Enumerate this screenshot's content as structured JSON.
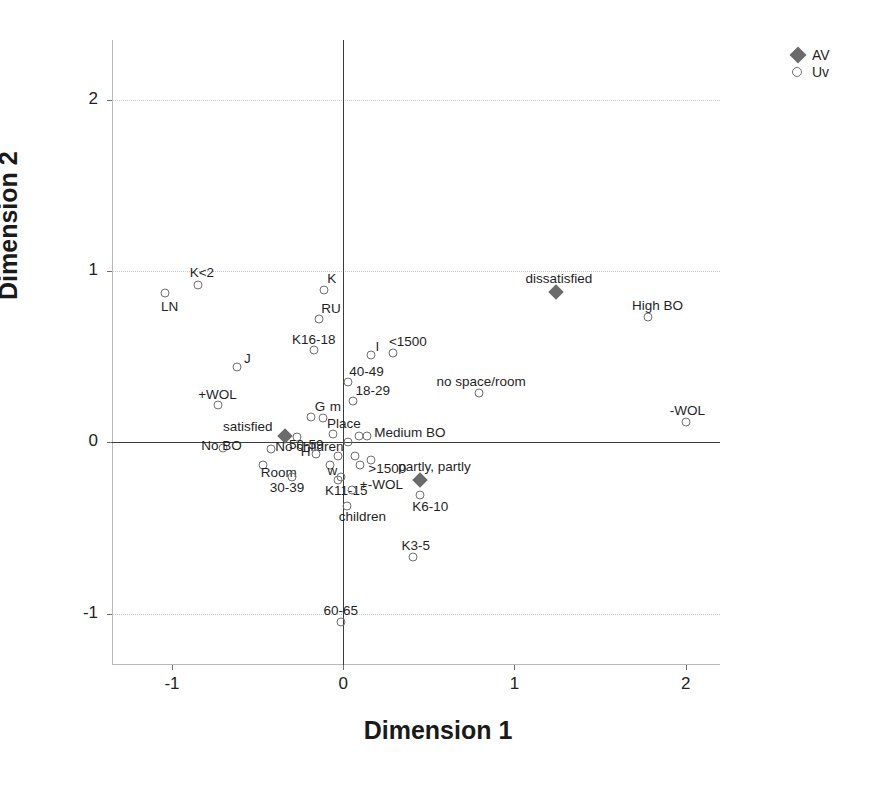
{
  "chart_data": {
    "type": "scatter",
    "title": "",
    "xlabel": "Dimension 1",
    "ylabel": "Dimension 2",
    "xlim": [
      -1.35,
      2.2
    ],
    "ylim": [
      -1.3,
      2.35
    ],
    "xticks": [
      -1,
      0,
      1,
      2
    ],
    "xticklabels": [
      "-1",
      "0",
      "1",
      "2"
    ],
    "yticks": [
      2,
      1,
      0,
      -1
    ],
    "yticklabels": [
      "2",
      "1",
      "0",
      "-1"
    ],
    "grid": "dotted horizontal gridlines at y = 2, 1, -1; solid axis lines at x = 0 and y = 0",
    "legend_position": "top-right outside",
    "legend": [
      {
        "name": "AV",
        "marker": "filled-diamond",
        "color": "#6b6b6b"
      },
      {
        "name": "Uv",
        "marker": "open-circle",
        "color": "#707070"
      }
    ],
    "series": [
      {
        "name": "AV",
        "marker": "filled-diamond",
        "points": [
          {
            "label": "satisfied",
            "x": -0.34,
            "y": 0.04,
            "label_dx": -62,
            "label_dy": -16
          },
          {
            "label": "dissatisfied",
            "x": 1.24,
            "y": 0.88,
            "label_dx": -30,
            "label_dy": -20
          },
          {
            "label": "partly, partly",
            "x": 0.45,
            "y": -0.22,
            "label_dx": -22,
            "label_dy": -20
          }
        ]
      },
      {
        "name": "Uv",
        "marker": "open-circle",
        "points": [
          {
            "label": "K<2",
            "x": -0.85,
            "y": 0.92,
            "label_dx": -8,
            "label_dy": -19
          },
          {
            "label": "LN",
            "x": -1.04,
            "y": 0.87,
            "label_dx": -4,
            "label_dy": 7
          },
          {
            "label": "K",
            "x": -0.11,
            "y": 0.89,
            "label_dx": 3,
            "label_dy": -18
          },
          {
            "label": "RU",
            "x": -0.14,
            "y": 0.72,
            "label_dx": 2,
            "label_dy": -17
          },
          {
            "label": "K16-18",
            "x": -0.17,
            "y": 0.54,
            "label_dx": -22,
            "label_dy": -17
          },
          {
            "label": "J",
            "x": -0.62,
            "y": 0.44,
            "label_dx": 7,
            "label_dy": -15
          },
          {
            "label": "+WOL",
            "x": -0.73,
            "y": 0.22,
            "label_dx": -20,
            "label_dy": -17
          },
          {
            "label": "I",
            "x": 0.16,
            "y": 0.51,
            "label_dx": 5,
            "label_dy": -15
          },
          {
            "label": "<1500",
            "x": 0.29,
            "y": 0.52,
            "label_dx": -4,
            "label_dy": -18
          },
          {
            "label": "40-49",
            "x": 0.03,
            "y": 0.35,
            "label_dx": 1,
            "label_dy": -17
          },
          {
            "label": "no space/room",
            "x": 0.79,
            "y": 0.29,
            "label_dx": -42,
            "label_dy": -18
          },
          {
            "label": "High BO",
            "x": 1.78,
            "y": 0.73,
            "label_dx": -16,
            "label_dy": -18
          },
          {
            "label": "-WOL",
            "x": 2.0,
            "y": 0.12,
            "label_dx": -16,
            "label_dy": -18
          },
          {
            "label": "18-29",
            "x": 0.06,
            "y": 0.24,
            "label_dx": 2,
            "label_dy": -17
          },
          {
            "label": "G",
            "x": -0.19,
            "y": 0.15,
            "label_dx": 4,
            "label_dy": -17
          },
          {
            "label": "m",
            "x": -0.12,
            "y": 0.14,
            "label_dx": 7,
            "label_dy": -18
          },
          {
            "label": "Place",
            "x": -0.06,
            "y": 0.05,
            "label_dx": -6,
            "label_dy": -17
          },
          {
            "label": "Medium BO",
            "x": 0.14,
            "y": 0.04,
            "label_dx": 7,
            "label_dy": -10
          },
          {
            "label": "50-59",
            "x": -0.27,
            "y": 0.03,
            "label_dx": -8,
            "label_dy": 1
          },
          {
            "label": "No BO",
            "x": -0.7,
            "y": -0.03,
            "label_dx": -22,
            "label_dy": -9
          },
          {
            "label": "No children",
            "x": -0.42,
            "y": -0.04,
            "label_dx": 4,
            "label_dy": -9
          },
          {
            "label": "H",
            "x": -0.16,
            "y": -0.07,
            "label_dx": -15,
            "label_dy": -9
          },
          {
            "label": "w",
            "x": -0.08,
            "y": -0.13,
            "label_dx": -2,
            "label_dy": -1
          },
          {
            "label": ">1500",
            "x": 0.1,
            "y": -0.13,
            "label_dx": 8,
            "label_dy": -3
          },
          {
            "label": "Room",
            "x": -0.47,
            "y": -0.13,
            "label_dx": -2,
            "label_dy": 1
          },
          {
            "label": "30-39",
            "x": -0.3,
            "y": -0.2,
            "label_dx": -22,
            "label_dy": 4
          },
          {
            "label": "K11-15",
            "x": -0.03,
            "y": -0.22,
            "label_dx": -13,
            "label_dy": 4
          },
          {
            "label": "+-WOL",
            "x": 0.05,
            "y": -0.28,
            "label_dx": 8,
            "label_dy": -12
          },
          {
            "label": "children",
            "x": 0.02,
            "y": -0.37,
            "label_dx": -8,
            "label_dy": 4
          },
          {
            "label": "K6-10",
            "x": 0.45,
            "y": -0.31,
            "label_dx": -8,
            "label_dy": 5
          },
          {
            "label": "K3-5",
            "x": 0.41,
            "y": -0.67,
            "label_dx": -12,
            "label_dy": -18
          },
          {
            "label": "60-65",
            "x": -0.01,
            "y": -1.05,
            "label_dx": -18,
            "label_dy": -18
          },
          {
            "label": "",
            "x": 0.03,
            "y": 0.0,
            "label_dx": 0,
            "label_dy": 0
          },
          {
            "label": "",
            "x": -0.03,
            "y": -0.08,
            "label_dx": 0,
            "label_dy": 0
          },
          {
            "label": "",
            "x": 0.07,
            "y": -0.08,
            "label_dx": 0,
            "label_dy": 0
          },
          {
            "label": "",
            "x": 0.16,
            "y": -0.1,
            "label_dx": 0,
            "label_dy": 0
          },
          {
            "label": "",
            "x": 0.09,
            "y": 0.04,
            "label_dx": 0,
            "label_dy": 0
          },
          {
            "label": "",
            "x": -0.01,
            "y": -0.2,
            "label_dx": 0,
            "label_dy": 0
          }
        ]
      }
    ]
  }
}
